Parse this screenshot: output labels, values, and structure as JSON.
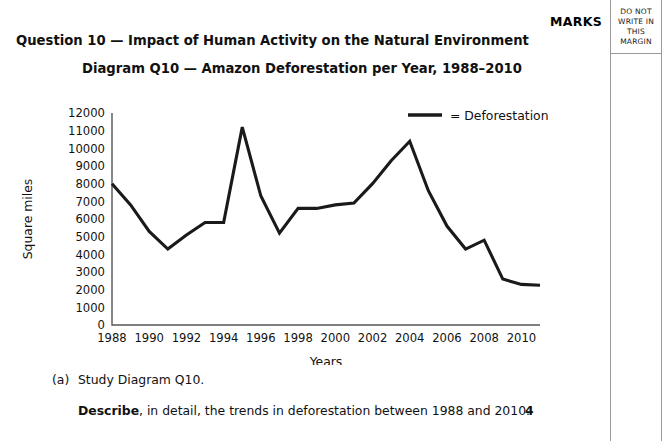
{
  "page": {
    "marks_label": "MARKS",
    "margin_note_lines": [
      "DO NOT",
      "WRITE IN",
      "THIS",
      "MARGIN"
    ]
  },
  "headings": {
    "question": "Question 10 — Impact of Human Activity on the Natural Environment",
    "diagram": "Diagram Q10 — Amazon Deforestation per Year, 1988–2010"
  },
  "question_parts": [
    {
      "letter": "(a)",
      "stem": "Study Diagram Q10.",
      "instruction_bold": "Describe",
      "instruction_rest": ", in detail, the trends in deforestation between 1988 and 2010.",
      "marks": "4"
    }
  ],
  "chart_data": {
    "type": "line",
    "title": "Diagram Q10 — Amazon Deforestation per Year, 1988–2010",
    "xlabel": "Years",
    "ylabel": "Square miles",
    "legend_position": "top-right",
    "legend_entries": [
      "= Deforestation"
    ],
    "grid": false,
    "line_color": "#1a1a1a",
    "xlim": [
      1988,
      2011
    ],
    "ylim": [
      0,
      12000
    ],
    "ytick_labels": [
      "12000",
      "11000",
      "10000",
      "9000",
      "8000",
      "7000",
      "6000",
      "5000",
      "4000",
      "3000",
      "2000",
      "1000",
      "0"
    ],
    "ytick_values": [
      12000,
      11000,
      10000,
      9000,
      8000,
      7000,
      6000,
      5000,
      4000,
      3000,
      2000,
      1000,
      0
    ],
    "xtick_labels": [
      "1988",
      "1990",
      "1992",
      "1994",
      "1996",
      "1998",
      "2000",
      "2002",
      "2004",
      "2006",
      "2008",
      "2010"
    ],
    "xtick_values": [
      1988,
      1990,
      1992,
      1994,
      1996,
      1998,
      2000,
      2002,
      2004,
      2006,
      2008,
      2010
    ],
    "x": [
      1988,
      1989,
      1990,
      1991,
      1992,
      1993,
      1994,
      1995,
      1996,
      1997,
      1998,
      1999,
      2000,
      2001,
      2002,
      2003,
      2004,
      2005,
      2006,
      2007,
      2008,
      2009,
      2010,
      2011
    ],
    "series": [
      {
        "name": "Deforestation",
        "values": [
          8000,
          6800,
          5300,
          4300,
          5100,
          5800,
          5800,
          11200,
          7300,
          5200,
          6600,
          6600,
          6800,
          6900,
          8000,
          9300,
          10400,
          7600,
          5600,
          4300,
          4800,
          2600,
          2300,
          2250
        ]
      }
    ]
  }
}
